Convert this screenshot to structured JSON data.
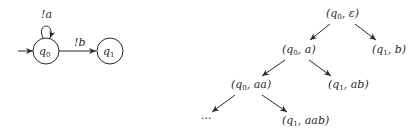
{
  "automaton": {
    "states": [
      {
        "id": "q0",
        "label": "q",
        "sub": "0",
        "initial": true
      },
      {
        "id": "q1",
        "label": "q",
        "sub": "1",
        "initial": false
      }
    ],
    "transitions": [
      {
        "from": "q0",
        "to": "q0",
        "label": "!a"
      },
      {
        "from": "q0",
        "to": "q1",
        "label": "!b"
      }
    ]
  },
  "tree": {
    "nodes": [
      {
        "id": "root",
        "state": "q",
        "sub": "0",
        "word": "ε"
      },
      {
        "id": "n1",
        "state": "q",
        "sub": "0",
        "word": "a"
      },
      {
        "id": "n2",
        "state": "q",
        "sub": "1",
        "word": "b"
      },
      {
        "id": "n3",
        "state": "q",
        "sub": "0",
        "word": "aa"
      },
      {
        "id": "n4",
        "state": "q",
        "sub": "1",
        "word": "ab"
      },
      {
        "id": "n5",
        "state": "q",
        "sub": "1",
        "word": "aab"
      }
    ],
    "ellipsis": "..."
  },
  "labels": {
    "loop": "!a",
    "edge": "!b",
    "q": "q",
    "s0": "0",
    "s1": "1",
    "root_word": "ε",
    "n1_word": "a",
    "n2_word": "b",
    "n3_word": "aa",
    "n4_word": "ab",
    "n5_word": "aab",
    "ellipsis": "..."
  }
}
